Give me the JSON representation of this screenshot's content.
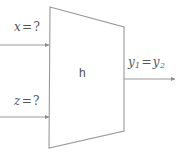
{
  "diagram": {
    "type": "block-diagram",
    "background_color": "#ffffff",
    "stroke_color": "#999999",
    "text_color": "#555555",
    "block": {
      "shape": "trapezoid",
      "label": "h",
      "vertices": [
        [
          50,
          7
        ],
        [
          124,
          27
        ],
        [
          124,
          131
        ],
        [
          49,
          148
        ]
      ]
    },
    "inputs": [
      {
        "name": "input-x",
        "label_var": "x",
        "label_op": "=",
        "label_value": "?",
        "label_text": "x = ?",
        "arrow": {
          "x1": 0,
          "y1": 45,
          "x2": 50,
          "y2": 45,
          "direction": "right"
        }
      },
      {
        "name": "input-z",
        "label_var": "z",
        "label_op": "=",
        "label_value": "?",
        "label_text": "z = ?",
        "arrow": {
          "x1": 0,
          "y1": 117,
          "x2": 50,
          "y2": 117,
          "direction": "right"
        }
      }
    ],
    "outputs": [
      {
        "name": "output-y",
        "label_var": "y",
        "label_sub_1": "1",
        "label_op": "=",
        "label_var_2": "y",
        "label_sub_2": "2",
        "label_text": "y1 = y2",
        "arrow": {
          "x1": 124,
          "y1": 79,
          "x2": 176,
          "y2": 79,
          "direction": "right"
        }
      }
    ]
  }
}
